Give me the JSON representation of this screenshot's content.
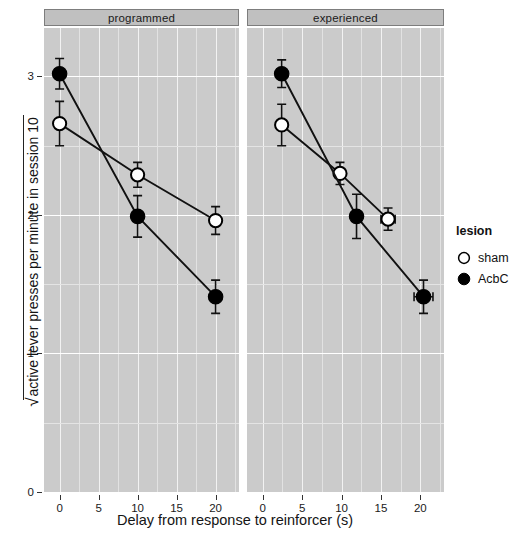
{
  "figure": {
    "xlabel": "Delay from response to reinforcer (s)",
    "ylabel": "active lever presses per minute in session 10",
    "radical": "√"
  },
  "legend": {
    "title": "lesion",
    "items": [
      {
        "label": "sham",
        "marker": "open-circle",
        "color": "#ffffff"
      },
      {
        "label": "AcbC",
        "marker": "filled-circle",
        "color": "#000000"
      }
    ]
  },
  "chart_data": {
    "type": "line",
    "title": "",
    "xlabel": "Delay from response to reinforcer (s)",
    "ylabel": "√active lever presses per minute in session 10",
    "xlim": [
      -2,
      23
    ],
    "ylim": [
      0,
      3.35
    ],
    "xticks": [
      0,
      5,
      10,
      15,
      20
    ],
    "yticks": [
      0,
      1,
      2,
      3
    ],
    "grid": true,
    "legend_position": "right",
    "error_bars": "SEM",
    "panels": [
      {
        "label": "programmed",
        "series": [
          {
            "name": "sham",
            "marker": "open-circle",
            "points": [
              {
                "x": 0,
                "y": 2.66,
                "yerr": 0.16,
                "xerr": 0
              },
              {
                "x": 10,
                "y": 2.29,
                "yerr": 0.09,
                "xerr": 0
              },
              {
                "x": 20,
                "y": 1.96,
                "yerr": 0.1,
                "xerr": 0
              }
            ]
          },
          {
            "name": "AcbC",
            "marker": "filled-circle",
            "points": [
              {
                "x": 0,
                "y": 3.02,
                "yerr": 0.11,
                "xerr": 0
              },
              {
                "x": 10,
                "y": 1.99,
                "yerr": 0.15,
                "xerr": 0
              },
              {
                "x": 20,
                "y": 1.41,
                "yerr": 0.12,
                "xerr": 0
              }
            ]
          }
        ]
      },
      {
        "label": "experienced",
        "series": [
          {
            "name": "sham",
            "marker": "open-circle",
            "points": [
              {
                "x": 2.4,
                "y": 2.65,
                "yerr": 0.15,
                "xerr": 0
              },
              {
                "x": 9.8,
                "y": 2.3,
                "yerr": 0.08,
                "xerr": 0
              },
              {
                "x": 15.9,
                "y": 1.97,
                "yerr": 0.08,
                "xerr": 0.9
              }
            ]
          },
          {
            "name": "AcbC",
            "marker": "filled-circle",
            "points": [
              {
                "x": 2.4,
                "y": 3.02,
                "yerr": 0.1,
                "xerr": 0
              },
              {
                "x": 11.9,
                "y": 1.99,
                "yerr": 0.16,
                "xerr": 0
              },
              {
                "x": 20.4,
                "y": 1.41,
                "yerr": 0.12,
                "xerr": 1.2
              }
            ]
          }
        ]
      }
    ]
  }
}
